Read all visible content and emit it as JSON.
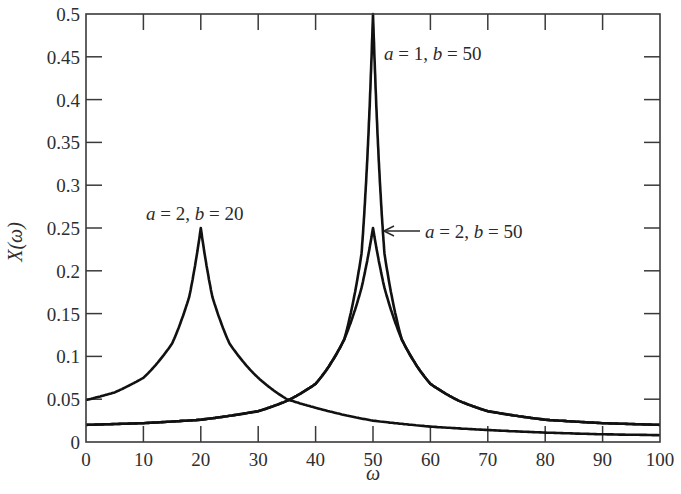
{
  "chart_data": {
    "type": "line",
    "title": "",
    "xlabel": "ω",
    "ylabel": "X(ω)",
    "xlim": [
      0,
      100
    ],
    "ylim": [
      0,
      0.5
    ],
    "grid": false,
    "legend": "none (inline annotations)",
    "x_ticks": [
      "0",
      "10",
      "20",
      "30",
      "40",
      "50",
      "60",
      "70",
      "80",
      "90",
      "100"
    ],
    "y_ticks": [
      "0",
      "0.05",
      "0.1",
      "0.15",
      "0.2",
      "0.25",
      "0.3",
      "0.35",
      "0.4",
      "0.45",
      "0.5"
    ],
    "series": [
      {
        "name": "a = 2, b = 20",
        "a": 2,
        "b": 20,
        "x": [
          0,
          5,
          10,
          15,
          18,
          20,
          22,
          25,
          30,
          35,
          40,
          50,
          60,
          70,
          80,
          90,
          100
        ],
        "values": [
          0.049,
          0.058,
          0.075,
          0.115,
          0.17,
          0.25,
          0.17,
          0.115,
          0.075,
          0.05,
          0.04,
          0.025,
          0.018,
          0.014,
          0.011,
          0.009,
          0.008
        ]
      },
      {
        "name": "a = 2, b = 50",
        "a": 2,
        "b": 50,
        "x": [
          0,
          10,
          20,
          30,
          35,
          40,
          45,
          48,
          50,
          52,
          55,
          60,
          65,
          70,
          80,
          90,
          100
        ],
        "values": [
          0.02,
          0.022,
          0.026,
          0.036,
          0.048,
          0.068,
          0.12,
          0.18,
          0.25,
          0.18,
          0.12,
          0.068,
          0.048,
          0.036,
          0.026,
          0.022,
          0.02
        ]
      },
      {
        "name": "a = 1, b = 50",
        "a": 1,
        "b": 50,
        "x": [
          0,
          10,
          20,
          30,
          35,
          40,
          45,
          48,
          49,
          50,
          51,
          52,
          55,
          60,
          65,
          70,
          80,
          90,
          100
        ],
        "values": [
          0.02,
          0.022,
          0.026,
          0.036,
          0.048,
          0.068,
          0.12,
          0.22,
          0.33,
          0.5,
          0.33,
          0.22,
          0.12,
          0.068,
          0.048,
          0.036,
          0.026,
          0.022,
          0.02
        ]
      }
    ],
    "annotations": [
      {
        "text": "a = 2, b = 20",
        "near": {
          "x": 20,
          "y": 0.27
        }
      },
      {
        "text": "a = 1, b = 50",
        "near": {
          "x": 52,
          "y": 0.46
        }
      },
      {
        "text": "a = 2, b = 50",
        "near": {
          "x": 60,
          "y": 0.245
        },
        "arrow_to": {
          "x": 50.5,
          "y": 0.245
        }
      }
    ]
  },
  "labels": {
    "ylabel": "X(ω)",
    "xlabel": "ω",
    "annot_a2b20": {
      "a": "a",
      "mid1": " = 2, ",
      "b": "b",
      "mid2": " = 20"
    },
    "annot_a1b50": {
      "a": "a",
      "mid1": " = 1, ",
      "b": "b",
      "mid2": " = 50"
    },
    "annot_a2b50": {
      "a": "a",
      "mid1": " = 2, ",
      "b": "b",
      "mid2": " = 50"
    }
  }
}
